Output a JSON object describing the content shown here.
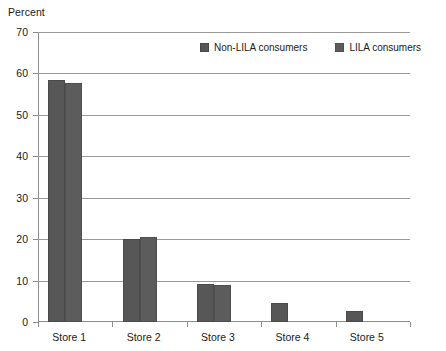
{
  "chart_data": {
    "type": "bar",
    "title": "",
    "ylabel": "Percent",
    "xlabel": "",
    "ylim": [
      0,
      70
    ],
    "ytick_step": 10,
    "yticks": [
      0,
      10,
      20,
      30,
      40,
      50,
      60,
      70
    ],
    "grid": true,
    "legend_position": "top-right",
    "categories": [
      "Store  1",
      "Store 2",
      "Store 3",
      "Store 4",
      "Store 5"
    ],
    "series": [
      {
        "name": "Non-LILA consumers",
        "color": "#575757",
        "values": [
          58.3,
          20.0,
          9.2,
          4.7,
          2.7
        ]
      },
      {
        "name": "LILA consumers",
        "color": "#5c5c5c",
        "values": [
          57.8,
          20.6,
          9.0,
          0,
          0
        ]
      }
    ]
  },
  "legend": {
    "items": [
      {
        "label": "Non-LILA consumers"
      },
      {
        "label": "LILA consumers"
      }
    ]
  }
}
